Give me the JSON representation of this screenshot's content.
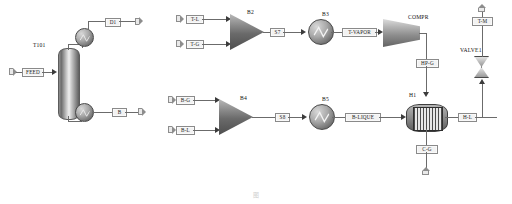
{
  "diagram": {
    "caption": "图",
    "accent_color": "#6b6b6b",
    "blocks": [
      {
        "id": "T101",
        "label": "T101",
        "type": "distillation-column"
      },
      {
        "id": "B2",
        "label": "B2",
        "type": "mixer"
      },
      {
        "id": "B3",
        "label": "B3",
        "type": "heat-exchanger"
      },
      {
        "id": "B4",
        "label": "B4",
        "type": "mixer"
      },
      {
        "id": "B5",
        "label": "B5",
        "type": "heat-exchanger"
      },
      {
        "id": "COMPR",
        "label": "COMPR",
        "type": "compressor"
      },
      {
        "id": "H1",
        "label": "H1",
        "type": "shell-tube-exchanger"
      },
      {
        "id": "VALVE1",
        "label": "VALVE1",
        "type": "valve"
      }
    ],
    "streams": [
      {
        "id": "FEED",
        "label": "FEED"
      },
      {
        "id": "D1",
        "label": "D1"
      },
      {
        "id": "B",
        "label": "B"
      },
      {
        "id": "T-L",
        "label": "T-L"
      },
      {
        "id": "T-G",
        "label": "T-G"
      },
      {
        "id": "S7",
        "label": "S7"
      },
      {
        "id": "T-VAPOR",
        "label": "T-VAPOR"
      },
      {
        "id": "HP-G",
        "label": "HP-G"
      },
      {
        "id": "B-G",
        "label": "B-G"
      },
      {
        "id": "B-L",
        "label": "B-L"
      },
      {
        "id": "S8",
        "label": "S8"
      },
      {
        "id": "B-LIQUE",
        "label": "B-LIQUE"
      },
      {
        "id": "H-L",
        "label": "H-L"
      },
      {
        "id": "C-G",
        "label": "C-G"
      },
      {
        "id": "T-M",
        "label": "T-M"
      }
    ]
  }
}
